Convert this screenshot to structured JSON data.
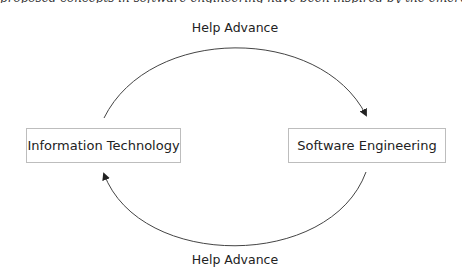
{
  "diagram": {
    "top_cut_text": "proposed concepts in software engineering have been inspired by the emergence of technologies and",
    "nodes": [
      {
        "id": "it",
        "label": "Information Technology"
      },
      {
        "id": "se",
        "label": "Software Engineering"
      }
    ],
    "edges": [
      {
        "from": "it",
        "to": "se",
        "label": "Help Advance",
        "position": "top"
      },
      {
        "from": "se",
        "to": "it",
        "label": "Help Advance",
        "position": "bottom"
      }
    ],
    "colors": {
      "line": "#333333",
      "box_border": "#bdbdbd",
      "text": "#222222"
    }
  }
}
